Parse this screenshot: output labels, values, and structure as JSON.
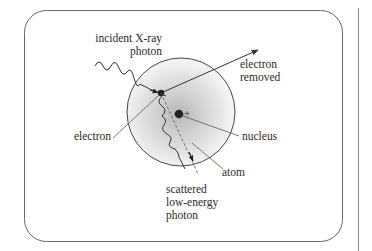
{
  "diagram": {
    "colors": {
      "stroke": "#333333",
      "frame": "#555555",
      "atom_fill_center": "#bdbdbd",
      "atom_fill_edge": "#ffffff",
      "nucleus": "#2a2a2a",
      "text": "#2a2a2a"
    },
    "labels": {
      "incident_line1": "incident X-ray",
      "incident_line2": "photon",
      "electron_removed_line1": "electron",
      "electron_removed_line2": "removed",
      "electron": "electron",
      "nucleus": "nucleus",
      "nucleus_charge": "+",
      "atom": "atom",
      "scattered_line1": "scattered",
      "scattered_line2": "low-energy",
      "scattered_line3": "photon"
    },
    "elements": [
      {
        "id": "frame",
        "kind": "rounded-rectangle"
      },
      {
        "id": "atom",
        "kind": "shaded-circle"
      },
      {
        "id": "nucleus",
        "kind": "dot",
        "charge": "+"
      },
      {
        "id": "electron",
        "kind": "dot"
      },
      {
        "id": "incident-photon",
        "kind": "wavy-arrow"
      },
      {
        "id": "ejected-electron",
        "kind": "straight-arrow"
      },
      {
        "id": "scattered-photon",
        "kind": "wavy-arrow"
      }
    ]
  }
}
